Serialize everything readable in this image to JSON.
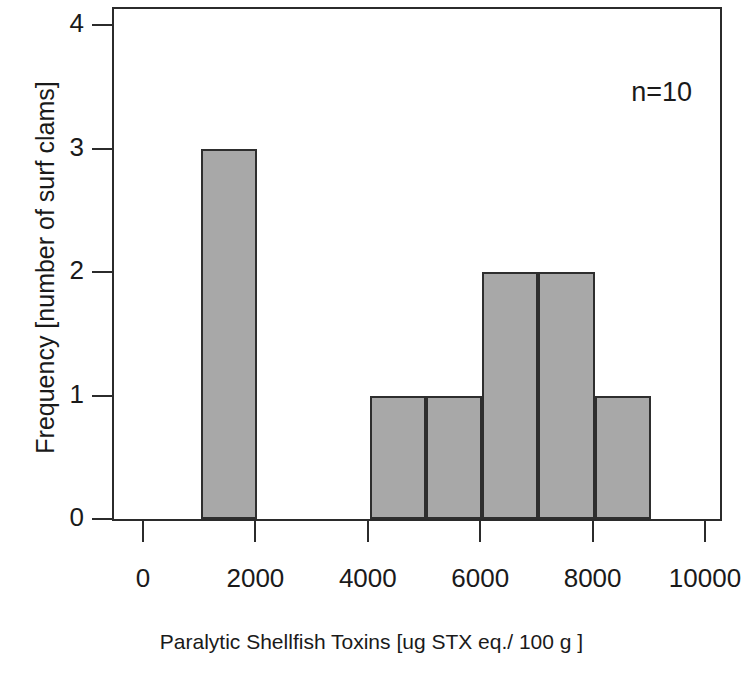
{
  "chart_data": {
    "type": "bar",
    "title": "",
    "subtitle": "",
    "xlabel": "Paralytic Shellfish Toxins [ug STX eq./ 100 g ]",
    "ylabel": "Frequency [number of surf clams]",
    "xlim": [
      0,
      10000
    ],
    "ylim": [
      0,
      4
    ],
    "grid": false,
    "legend": "none",
    "bin_width": 1000,
    "categories": [
      "0-1000",
      "1000-2000",
      "2000-3000",
      "3000-4000",
      "4000-5000",
      "5000-6000",
      "6000-7000",
      "7000-8000",
      "8000-9000",
      "9000-10000"
    ],
    "values": [
      0,
      3,
      0,
      0,
      1,
      1,
      2,
      2,
      1,
      0
    ],
    "bins": [
      {
        "start": 1000,
        "end": 2000,
        "count": 3
      },
      {
        "start": 4000,
        "end": 5000,
        "count": 1
      },
      {
        "start": 5000,
        "end": 6000,
        "count": 1
      },
      {
        "start": 6000,
        "end": 7000,
        "count": 2
      },
      {
        "start": 7000,
        "end": 8000,
        "count": 2
      },
      {
        "start": 8000,
        "end": 9000,
        "count": 1
      }
    ],
    "x_ticks": [
      0,
      2000,
      4000,
      6000,
      8000,
      10000
    ],
    "x_tick_labels": [
      "0",
      "2000",
      "4000",
      "6000",
      "8000",
      "10000"
    ],
    "y_ticks": [
      0,
      1,
      2,
      3,
      4
    ],
    "y_tick_labels": [
      "0",
      "1",
      "2",
      "3",
      "4"
    ],
    "annotations": [
      {
        "text": "n=10",
        "position": "top-right"
      }
    ],
    "colors": {
      "bar_fill": "#a8a8a8",
      "bar_edge": "#2e2e2e",
      "axis": "#2b2b2b",
      "text": "#1a1a1a",
      "background": "#ffffff"
    }
  },
  "axes": {
    "y_title": "Frequency [number of surf clams]",
    "x_title": "Paralytic Shellfish Toxins [ug STX eq./ 100 g ]",
    "y_tick_labels": [
      "0",
      "1",
      "2",
      "3",
      "4"
    ],
    "x_tick_labels": [
      "0",
      "2000",
      "4000",
      "6000",
      "8000",
      "10000"
    ]
  },
  "annotation": {
    "sample_size": "n=10"
  }
}
